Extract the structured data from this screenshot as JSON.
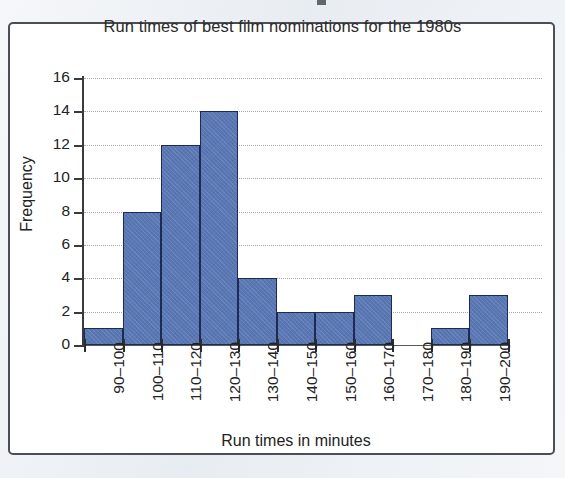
{
  "figure": {
    "border_color": "#4b4f55",
    "page_background": "#e9edf2"
  },
  "chart_data": {
    "type": "bar",
    "title": "Run times of best film nominations for the 1980s",
    "xlabel": "Run times in minutes",
    "ylabel": "Frequency",
    "categories": [
      "90–100",
      "100–110",
      "110–120",
      "120–130",
      "130–140",
      "140–150",
      "150–160",
      "160–170",
      "170–180",
      "180–190",
      "190–200"
    ],
    "values": [
      1,
      8,
      12,
      14,
      4,
      2,
      2,
      3,
      0,
      1,
      3
    ],
    "ylim": [
      0,
      16
    ],
    "ytick_labels": [
      "0",
      "2",
      "4",
      "6",
      "8",
      "10",
      "12",
      "14",
      "16"
    ],
    "ytick_values": [
      0,
      2,
      4,
      6,
      8,
      10,
      12,
      14,
      16
    ],
    "grid": "horizontal-dotted",
    "legend": "none",
    "bar_fill_color": "#5877b4",
    "bar_border_color": "#1b2b54",
    "gridline_color": "#a8a8a8",
    "axis_color": "#3a3a3a"
  }
}
